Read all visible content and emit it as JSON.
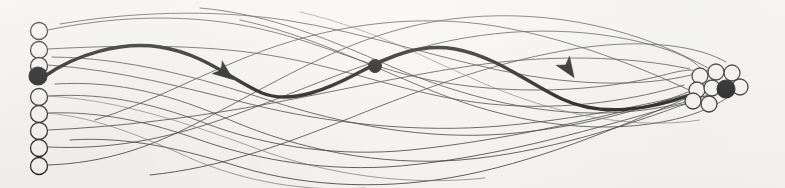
{
  "figure": {
    "title": "Graph trajectory diagram",
    "background_color": "#f6f5f3",
    "ink_color": "#111111",
    "width": 785,
    "height": 188
  },
  "legend": {
    "hollow_node_meaning": "unvisited node",
    "filled_node_meaning": "selected / active node",
    "thin_edge_meaning": "candidate edge",
    "thick_edge_meaning": "highlighted traversal path",
    "arrow_meaning": "direction of traversal"
  },
  "left_column": {
    "name": "source-node-column",
    "x": 39,
    "node_radius": 8.5,
    "count": 9,
    "nodes": [
      {
        "id": "L1",
        "cx": 39,
        "cy": 31,
        "r": 8.5,
        "state": "hollow"
      },
      {
        "id": "L2",
        "cx": 39,
        "cy": 50,
        "r": 8.5,
        "state": "hollow"
      },
      {
        "id": "L3",
        "cx": 39,
        "cy": 66,
        "r": 8.5,
        "state": "hollow"
      },
      {
        "id": "L4",
        "cx": 38,
        "cy": 76,
        "r": 9.0,
        "state": "filled"
      },
      {
        "id": "L5",
        "cx": 39,
        "cy": 97,
        "r": 8.5,
        "state": "hollow"
      },
      {
        "id": "L6",
        "cx": 39,
        "cy": 114,
        "r": 8.5,
        "state": "hollow"
      },
      {
        "id": "L7",
        "cx": 39,
        "cy": 131,
        "r": 8.5,
        "state": "hollow"
      },
      {
        "id": "L8",
        "cx": 39,
        "cy": 148,
        "r": 8.5,
        "state": "hollow"
      },
      {
        "id": "L9",
        "cx": 39,
        "cy": 166,
        "r": 8.5,
        "state": "hollow"
      }
    ]
  },
  "right_cluster": {
    "name": "target-node-cluster",
    "count": 9,
    "node_radius": 8.0,
    "nodes": [
      {
        "id": "R1",
        "cx": 700,
        "cy": 76,
        "r": 8.0,
        "state": "hollow"
      },
      {
        "id": "R2",
        "cx": 716,
        "cy": 72,
        "r": 8.0,
        "state": "hollow"
      },
      {
        "id": "R3",
        "cx": 732,
        "cy": 73,
        "r": 8.0,
        "state": "hollow"
      },
      {
        "id": "R4",
        "cx": 697,
        "cy": 90,
        "r": 8.0,
        "state": "hollow"
      },
      {
        "id": "R5",
        "cx": 712,
        "cy": 88,
        "r": 8.0,
        "state": "hollow"
      },
      {
        "id": "R6",
        "cx": 740,
        "cy": 87,
        "r": 8.0,
        "state": "hollow"
      },
      {
        "id": "R7",
        "cx": 709,
        "cy": 104,
        "r": 8.0,
        "state": "hollow"
      },
      {
        "id": "R8",
        "cx": 693,
        "cy": 101,
        "r": 8.0,
        "state": "hollow"
      },
      {
        "id": "R9",
        "cx": 726,
        "cy": 89,
        "r": 9.0,
        "state": "filled"
      }
    ]
  },
  "highlight_path": {
    "name": "highlighted-traversal-path",
    "stroke_width": 3.4,
    "start_node": "L4",
    "end_node": "R9",
    "d": "M 45 76 C 75 55, 120 41, 160 47 C 205 54, 232 80, 262 93 C 292 105, 330 88, 360 72 C 390 56, 420 43, 455 49 C 495 56, 530 84, 562 99 C 600 117, 650 110, 690 95 C 705 90, 715 89, 722 89",
    "waypoints": [
      {
        "id": "W1",
        "cx": 375,
        "cy": 66,
        "r": 6.5,
        "label": "waypoint dot"
      }
    ],
    "arrows": [
      {
        "id": "A1",
        "x": 226,
        "y": 74,
        "angle": 38,
        "label": "direction arrow 1"
      },
      {
        "id": "A2",
        "x": 569,
        "y": 70,
        "angle": 56,
        "label": "direction arrow 2"
      }
    ]
  },
  "thin_edges": {
    "name": "candidate-edge-set",
    "count": 16,
    "paths": [
      "M 48 30 C 110 17, 175 14, 235 24 C 310 36, 360 66, 430 80 C 510 96, 600 92, 668 74 C 690 68, 698 70, 702 74",
      "M 48 49 C 120 45, 200 44, 268 55 C 350 68, 410 96, 490 104 C 570 112, 640 98, 684 85",
      "M 48 65 C 120 70, 185 88, 250 104 C 330 124, 420 133, 500 126 C 580 119, 650 104, 690 94",
      "M 48 96 C 110 92, 160 106, 210 125 C 270 147, 340 157, 410 150 C 500 141, 590 120, 666 101 C 684 96, 692 97, 696 99",
      "M 48 113 C 100 111, 150 122, 200 140 C 260 161, 330 172, 400 166 C 490 158, 580 133, 660 110 C 680 104, 690 103, 694 104",
      "M 48 130 C 115 127, 180 119, 245 108 C 320 95, 395 77, 470 66 C 550 54, 630 56, 690 69",
      "M 48 147 C 110 150, 165 139, 220 120 C 290 96, 360 62, 435 44 C 515 25, 600 27, 668 50 C 688 57, 696 63, 700 68",
      "M 48 165 C 105 163, 150 147, 195 124 C 260 91, 320 53, 390 32 C 470 8, 560 11, 640 38 C 678 51, 700 64, 712 70",
      "M 60 24 C 130 12, 210 9, 285 20 C 370 33, 450 63, 530 76 C 610 89, 675 83, 714 68",
      "M 55 84 C 120 80, 175 96, 230 120 C 300 150, 380 166, 460 160 C 545 153, 625 126, 688 103",
      "M 52 57 C 130 58, 200 78, 268 100 C 345 125, 425 140, 505 134 C 590 127, 660 104, 698 88",
      "M 150 175 C 220 168, 285 144, 350 118 C 425 88, 500 60, 580 48 C 650 38, 700 47, 726 62",
      "M 95 120 C 150 103, 205 72, 265 50 C 340 23, 420 14, 495 26 C 580 40, 660 76, 706 98",
      "M 70 140 C 130 136, 185 150, 240 167 C 310 188, 390 190, 465 175 C 550 158, 635 120, 692 96",
      "M 200 8 C 270 14, 330 40, 390 66 C 465 98, 545 118, 625 112 C 685 107, 720 92, 738 80",
      "M 240 20 C 310 35, 370 66, 435 92 C 510 122, 590 135, 662 122 C 700 115, 724 102, 734 92"
    ],
    "faint_paths": [
      "M 48 96 C 120 100, 190 124, 255 148 C 330 176, 410 186, 485 178",
      "M 48 113 C 100 118, 145 138, 190 158 C 245 182, 305 192, 365 188",
      "M 300 12 C 370 28, 425 58, 485 84 C 560 116, 635 130, 700 120"
    ]
  }
}
